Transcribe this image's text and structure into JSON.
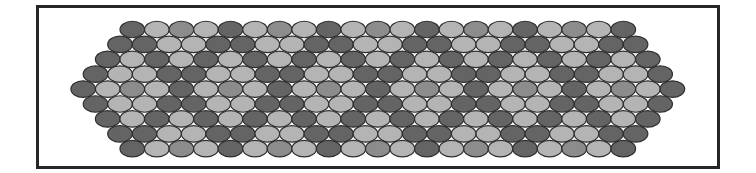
{
  "figure": {
    "type": "hexagonal-ellipse-packing",
    "rows": 9,
    "ellipse": {
      "width": 24.6,
      "height": 16.5,
      "pitch_x": 24.55,
      "pitch_y": 14.9
    },
    "colors": {
      "D": "#646464",
      "M": "#8c8c8c",
      "L": "#b4b4b4",
      "outline": "#2e2e2e",
      "frame": "#262626",
      "background": "#ffffff"
    },
    "row_layout": [
      {
        "count": 21,
        "x_start": 120.0,
        "cy": 29.5,
        "pattern": "DLML"
      },
      {
        "count": 22,
        "x_start": 107.7,
        "cy": 44.4,
        "pattern": "DDLL"
      },
      {
        "count": 23,
        "x_start": 95.4,
        "cy": 59.3,
        "pattern": "DL"
      },
      {
        "count": 24,
        "x_start": 83.2,
        "cy": 74.2,
        "pattern": "DLLD"
      },
      {
        "count": 25,
        "x_start": 70.9,
        "cy": 89.1,
        "pattern": "DLML"
      },
      {
        "count": 24,
        "x_start": 83.2,
        "cy": 104.0,
        "pattern": "DLLD"
      },
      {
        "count": 23,
        "x_start": 95.4,
        "cy": 118.9,
        "pattern": "DL"
      },
      {
        "count": 22,
        "x_start": 107.7,
        "cy": 133.8,
        "pattern": "DDLL"
      },
      {
        "count": 21,
        "x_start": 120.0,
        "cy": 148.7,
        "pattern": "DLML"
      }
    ]
  }
}
